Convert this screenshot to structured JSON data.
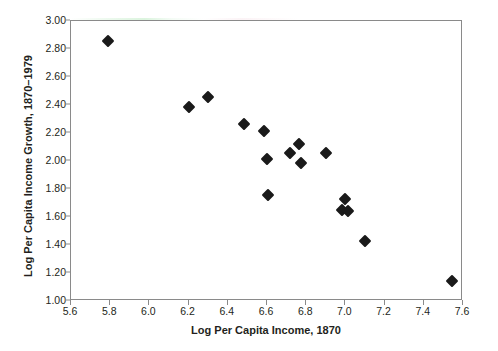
{
  "chart_data": {
    "type": "scatter",
    "title": "",
    "xlabel": "Log Per Capita Income, 1870",
    "ylabel": "Log Per Capita Income Growth, 1870–1979",
    "xlim": [
      5.6,
      7.6
    ],
    "ylim": [
      1.0,
      3.0
    ],
    "xticks": [
      "5.6",
      "5.8",
      "6.0",
      "6.2",
      "6.4",
      "6.6",
      "6.8",
      "7.0",
      "7.2",
      "7.4",
      "7.6"
    ],
    "xtick_values": [
      5.6,
      5.8,
      6.0,
      6.2,
      6.4,
      6.6,
      6.8,
      7.0,
      7.2,
      7.4,
      7.6
    ],
    "yticks": [
      "1.00",
      "1.20",
      "1.40",
      "1.60",
      "1.80",
      "2.00",
      "2.20",
      "2.40",
      "2.60",
      "2.80",
      "3.00"
    ],
    "ytick_values": [
      1.0,
      1.2,
      1.4,
      1.6,
      1.8,
      2.0,
      2.2,
      2.4,
      2.6,
      2.8,
      3.0
    ],
    "grid": false,
    "legend": null,
    "marker": "diamond",
    "marker_color": "#1a1a1a",
    "points": [
      {
        "x": 5.79,
        "y": 2.855
      },
      {
        "x": 6.2,
        "y": 2.385
      },
      {
        "x": 6.3,
        "y": 2.455
      },
      {
        "x": 6.485,
        "y": 2.265
      },
      {
        "x": 6.585,
        "y": 2.215
      },
      {
        "x": 6.6,
        "y": 2.015
      },
      {
        "x": 6.605,
        "y": 1.76
      },
      {
        "x": 6.715,
        "y": 2.055
      },
      {
        "x": 6.765,
        "y": 2.12
      },
      {
        "x": 6.775,
        "y": 1.985
      },
      {
        "x": 6.9,
        "y": 2.055
      },
      {
        "x": 7.0,
        "y": 1.73
      },
      {
        "x": 6.985,
        "y": 1.65
      },
      {
        "x": 7.015,
        "y": 1.64
      },
      {
        "x": 7.1,
        "y": 1.43
      },
      {
        "x": 7.545,
        "y": 1.14
      }
    ]
  }
}
